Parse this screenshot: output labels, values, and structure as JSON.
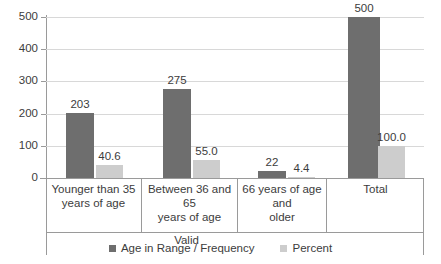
{
  "chart_data": {
    "type": "bar",
    "title": "",
    "subtitle": "",
    "xlabel": "",
    "ylabel": "",
    "categories": [
      "Younger than 35 years of age",
      "Between 36 and 65 years of age",
      "66 years of age and older",
      "Total"
    ],
    "category_lines": [
      [
        "Younger than 35",
        "years of age"
      ],
      [
        "Between 36 and 65",
        "years of age"
      ],
      [
        "66 years of age and",
        "older"
      ],
      [
        "Total"
      ]
    ],
    "group_bands": [
      {
        "label": "Valid",
        "spans": [
          0,
          1,
          2
        ]
      }
    ],
    "series": [
      {
        "name": "Age in Range / Frequency",
        "color": "#6e6e6e",
        "values": [
          203,
          275,
          22,
          500
        ],
        "labels": [
          "203",
          "275",
          "22",
          "500"
        ]
      },
      {
        "name": "Percent",
        "color": "#cdcdcd",
        "values": [
          40.6,
          55.0,
          4.4,
          100.0
        ],
        "labels": [
          "40.6",
          "55.0",
          "4.4",
          "100.0"
        ]
      }
    ],
    "ylim": [
      0,
      500
    ],
    "yticks": [
      0,
      100,
      200,
      300,
      400,
      500
    ],
    "ytick_labels": [
      "0",
      "100",
      "200",
      "300",
      "400",
      "500"
    ],
    "grid": true,
    "legend_position": "bottom",
    "axis_color": "#9a9a9a",
    "gridline_color": "#d8d8d8",
    "text_color": "#3c3c3c",
    "background": "#ffffff"
  }
}
